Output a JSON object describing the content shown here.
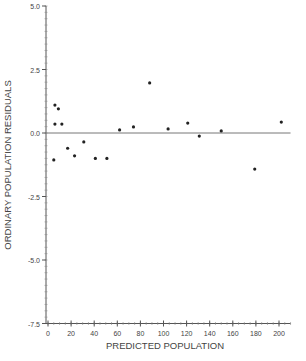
{
  "chart_data": {
    "type": "scatter",
    "title": "",
    "xlabel": "PREDICTED POPULATION",
    "ylabel": "ORDINARY POPULATION RESIDUALS",
    "xlim": [
      0,
      210
    ],
    "ylim": [
      -7.5,
      5.0
    ],
    "x_ticks": [
      0,
      20,
      40,
      60,
      80,
      100,
      120,
      140,
      160,
      180,
      200
    ],
    "y_ticks": [
      5.0,
      2.5,
      0.0,
      -2.5,
      -5.0,
      -7.5
    ],
    "y_tick_labels": [
      "5.0",
      "2.5",
      "0.0",
      "-2.5",
      "-5.0",
      "-7.5"
    ],
    "reference_line": {
      "y": 0.0
    },
    "grid": false,
    "legend": null,
    "points": [
      {
        "x": 6,
        "y": 0.35
      },
      {
        "x": 6,
        "y": 1.1
      },
      {
        "x": 9,
        "y": 0.95
      },
      {
        "x": 5,
        "y": -1.06
      },
      {
        "x": 12,
        "y": 0.35
      },
      {
        "x": 17,
        "y": -0.6
      },
      {
        "x": 23,
        "y": -0.9
      },
      {
        "x": 31,
        "y": -0.35
      },
      {
        "x": 41,
        "y": -1.0
      },
      {
        "x": 51,
        "y": -1.0
      },
      {
        "x": 62,
        "y": 0.12
      },
      {
        "x": 74,
        "y": 0.24
      },
      {
        "x": 88,
        "y": 1.97
      },
      {
        "x": 104,
        "y": 0.16
      },
      {
        "x": 121,
        "y": 0.39
      },
      {
        "x": 131,
        "y": -0.12
      },
      {
        "x": 150,
        "y": 0.08
      },
      {
        "x": 179,
        "y": -1.42
      },
      {
        "x": 202,
        "y": 0.43
      }
    ]
  },
  "colors": {
    "axis": "#555555",
    "points": "#222222",
    "text": "#444444"
  }
}
